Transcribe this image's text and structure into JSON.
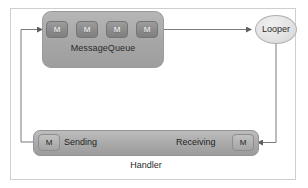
{
  "diagram": {
    "title_visible": false,
    "frame": {
      "border_color": "#cfcfcf",
      "background": "#ffffff"
    },
    "message_queue": {
      "label": "MessageQueue",
      "fill_color": "#a8a8a8",
      "messages": [
        {
          "label": "M"
        },
        {
          "label": "M"
        },
        {
          "label": "M"
        },
        {
          "label": "M"
        }
      ]
    },
    "looper": {
      "label": "Looper",
      "fill_color": "#e3e3e3",
      "shape": "ellipse"
    },
    "handler": {
      "label": "Handler",
      "fill_color": "#ababab",
      "sending": {
        "label": "Sending",
        "message": "M"
      },
      "receiving": {
        "label": "Receiving",
        "message": "M"
      }
    },
    "connectors": [
      {
        "name": "sending-to-queue",
        "from": "handler.sending",
        "to": "message_queue.messages.0",
        "style": "orthogonal-left-loop"
      },
      {
        "name": "queue-to-looper",
        "from": "message_queue.messages.3",
        "to": "looper",
        "style": "straight-horizontal"
      },
      {
        "name": "looper-to-receiving",
        "from": "looper",
        "to": "handler.receiving",
        "style": "orthogonal-right-loop"
      },
      {
        "name": "queue-chain-1",
        "from": "message_queue.messages.0",
        "to": "message_queue.messages.1",
        "style": "short-arrow"
      },
      {
        "name": "queue-chain-2",
        "from": "message_queue.messages.1",
        "to": "message_queue.messages.2",
        "style": "short-arrow"
      },
      {
        "name": "queue-chain-3",
        "from": "message_queue.messages.2",
        "to": "message_queue.messages.3",
        "style": "short-arrow"
      }
    ],
    "colors": {
      "line": "#6e6e6e",
      "message_box": "#8c8c8c",
      "text_dark": "#2b2b2b",
      "text_light": "#ffffff"
    }
  }
}
